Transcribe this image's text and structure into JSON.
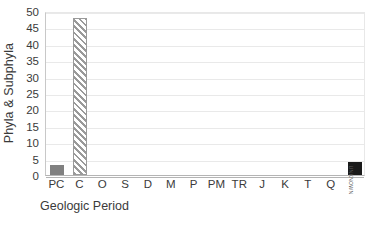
{
  "chart_data": {
    "type": "bar",
    "title": "",
    "subtitle": "",
    "xlabel": "Geologic Period",
    "ylabel": "Phyla & Subphyla",
    "categories": [
      "PC",
      "C",
      "O",
      "S",
      "D",
      "M",
      "P",
      "PM",
      "TR",
      "J",
      "K",
      "T",
      "Q",
      "UNKNOWN"
    ],
    "values": [
      3,
      48,
      0,
      0,
      0,
      0,
      0,
      0,
      0,
      0,
      0,
      0,
      0,
      4
    ],
    "ylim": [
      0,
      50
    ],
    "ytick_step": 5,
    "ytick_labels": [
      "0",
      "5",
      "10",
      "15",
      "20",
      "25",
      "30",
      "35",
      "40",
      "45",
      "50"
    ],
    "grid": "horizontal",
    "legend": "none",
    "bar_styles": [
      "solid-gray",
      "hatch-gray",
      "solid-gray",
      "solid-gray",
      "solid-gray",
      "solid-gray",
      "solid-gray",
      "solid-gray",
      "solid-gray",
      "solid-gray",
      "solid-gray",
      "solid-gray",
      "solid-gray",
      "solid-black"
    ],
    "rotated_tick_indices": [
      13
    ],
    "colors": {
      "bar_gray": "#808080",
      "bar_hatch": "#9a9a9a",
      "bar_black": "#1a1a1a",
      "gridline": "#e9e9e9",
      "axis": "#b4b4b4",
      "text": "#3a3a3a",
      "background": "#ffffff"
    }
  }
}
